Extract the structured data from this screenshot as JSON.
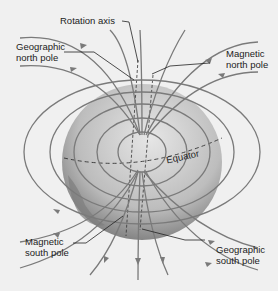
{
  "diagram": {
    "labels": {
      "rotation_axis": "Rotation axis",
      "geo_north_1": "Geographic",
      "geo_north_2": "north pole",
      "mag_north_1": "Magnetic",
      "mag_north_2": "north pole",
      "equator": "Equator",
      "mag_south_1": "Magnetic",
      "mag_south_2": "south pole",
      "geo_south_1": "Geographic",
      "geo_south_2": "south pole"
    },
    "colors": {
      "background": "#f0f0f0",
      "field_lines": "#7a7a7a",
      "globe_light": "#d8d8d8",
      "globe_dark": "#6a6a6a",
      "text": "#222222"
    }
  }
}
